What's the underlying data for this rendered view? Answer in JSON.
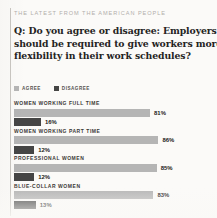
{
  "kicker": "THE LATEST FROM THE AMERICAN PEOPLE",
  "question": {
    "line1": "Q: Do you agree or disagree: Employers",
    "line2": "should be required to give workers more",
    "line3": "flexibility in their work schedules?"
  },
  "legend": {
    "agree_label": "AGREE",
    "disagree_label": "DISAGREE",
    "agree_color": "#b5b5b5",
    "disagree_color": "#454545"
  },
  "chart_data": {
    "type": "bar",
    "title": "Q: Do you agree or disagree: Employers should be required to give workers more flexibility in their work schedules?",
    "subtitle": "THE LATEST FROM THE AMERICAN PEOPLE",
    "orientation": "horizontal",
    "grouped": true,
    "xlabel": "",
    "ylabel": "",
    "xlim": [
      0,
      100
    ],
    "grid": false,
    "legend_position": "top-left",
    "categories": [
      "WOMEN WORKING FULL TIME",
      "WOMEN WORKING PART TIME",
      "PROFESSIONAL WOMEN",
      "BLUE-COLLAR WOMEN"
    ],
    "series": [
      {
        "name": "AGREE",
        "color": "#b5b5b5",
        "values": [
          81,
          86,
          85,
          83
        ],
        "labels": [
          "81%",
          "86%",
          "85%",
          "83%"
        ]
      },
      {
        "name": "DISAGREE",
        "color": "#454545",
        "values": [
          16,
          12,
          12,
          13
        ],
        "labels": [
          "16%",
          "12%",
          "12%",
          "13%"
        ]
      }
    ]
  },
  "groups": [
    {
      "label": "WOMEN WORKING FULL TIME",
      "agree_value": "81%",
      "agree_pct": 81,
      "disagree_value": "16%",
      "disagree_pct": 16
    },
    {
      "label": "WOMEN WORKING PART TIME",
      "agree_value": "86%",
      "agree_pct": 86,
      "disagree_value": "12%",
      "disagree_pct": 12
    },
    {
      "label": "PROFESSIONAL WOMEN",
      "agree_value": "85%",
      "agree_pct": 85,
      "disagree_value": "12%",
      "disagree_pct": 12
    },
    {
      "label": "BLUE-COLLAR WOMEN",
      "agree_value": "83%",
      "agree_pct": 83,
      "disagree_value": "13%",
      "disagree_pct": 13
    }
  ]
}
